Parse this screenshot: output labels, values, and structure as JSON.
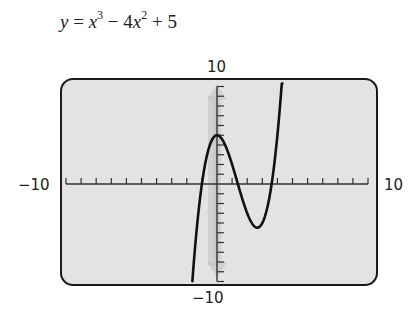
{
  "chart_data": {
    "type": "line",
    "title_parts": {
      "y": "y",
      "eq": " = ",
      "x1": "x",
      "exp1": "3",
      "minus": " − 4",
      "x2": "x",
      "exp2": "2",
      "plus": " + 5"
    },
    "function": "x^3 - 4*x^2 + 5",
    "xlabel": "",
    "ylabel": "",
    "xlim": [
      -10,
      10
    ],
    "ylim": [
      -10,
      10
    ],
    "xscale_ticks": 1,
    "yscale_ticks": 1,
    "tick_labels": {
      "x_min": "−10",
      "x_max": "10",
      "y_min": "−10",
      "y_max": "10"
    },
    "grid": false,
    "key_points": [
      {
        "label": "local max",
        "x": 0,
        "y": 5
      },
      {
        "label": "local min",
        "x": 2.67,
        "y": -4.48
      },
      {
        "label": "y-intercept",
        "x": 0,
        "y": 5
      }
    ],
    "x": [
      -1.63,
      -1.5,
      -1.25,
      -1.0,
      -0.75,
      -0.5,
      -0.25,
      0,
      0.25,
      0.5,
      0.75,
      1.0,
      1.25,
      1.5,
      1.75,
      2.0,
      2.25,
      2.5,
      2.67,
      2.75,
      3.0,
      3.25,
      3.5,
      3.75,
      4.0,
      4.2,
      4.33
    ],
    "series": [
      {
        "name": "y = x^3 - 4x^2 + 5",
        "color": "#111111"
      }
    ]
  },
  "colors": {
    "screen_bg": "#e3e3e3",
    "screen_border": "#1a1a1a",
    "axis": "#333333",
    "arrow_overlay": "#c9c9c9",
    "curve": "#111111"
  }
}
